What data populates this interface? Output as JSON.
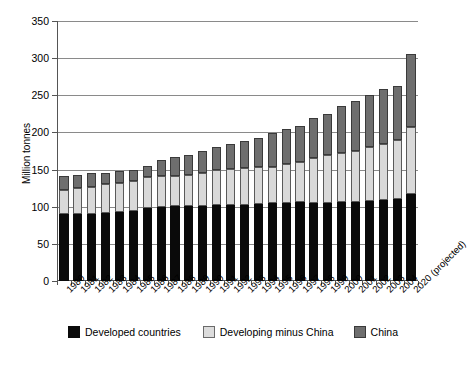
{
  "chart_data": {
    "type": "bar",
    "subtype": "stacked-vertical",
    "title": "",
    "xlabel": "",
    "ylabel": "Million tonnes",
    "ylim": [
      0,
      350
    ],
    "yticks": [
      0,
      50,
      100,
      150,
      200,
      250,
      300,
      350
    ],
    "grid": true,
    "legend_position": "bottom",
    "categories": [
      "1980",
      "1981",
      "1982",
      "1983",
      "1984",
      "1985",
      "1986",
      "1987",
      "1988",
      "1989",
      "1990",
      "1991",
      "1992",
      "1993",
      "1994",
      "1995",
      "1996",
      "1997",
      "1998",
      "1999",
      "2000",
      "2001",
      "2002",
      "2003",
      "2004",
      "2020 (projected)"
    ],
    "series": [
      {
        "name": "Developed countries",
        "color": "#0a0a0a",
        "values": [
          90,
          90,
          90,
          91,
          93,
          94,
          98,
          99,
          101,
          101,
          101,
          102,
          102,
          103,
          104,
          105,
          105,
          106,
          105,
          105,
          106,
          106,
          108,
          109,
          110,
          117
        ]
      },
      {
        "name": "Developing minus China",
        "color": "#d9d9d9",
        "values": [
          32,
          35,
          37,
          39,
          39,
          40,
          42,
          43,
          41,
          42,
          45,
          47,
          49,
          49,
          50,
          49,
          52,
          54,
          61,
          64,
          67,
          69,
          72,
          76,
          80,
          90
        ]
      },
      {
        "name": "China",
        "color": "#6e6e6e",
        "values": [
          19,
          18,
          18,
          16,
          16,
          16,
          15,
          21,
          25,
          27,
          29,
          31,
          33,
          37,
          39,
          45,
          48,
          49,
          53,
          56,
          62,
          67,
          70,
          73,
          73,
          99
        ]
      }
    ],
    "totals": [
      141,
      143,
      145,
      146,
      148,
      150,
      155,
      163,
      167,
      170,
      175,
      180,
      184,
      189,
      193,
      199,
      205,
      209,
      219,
      225,
      235,
      242,
      250,
      258,
      263,
      306
    ]
  },
  "legend": {
    "items": [
      {
        "label": "Developed countries",
        "swatch": "black-square"
      },
      {
        "label": "Developing minus China",
        "swatch": "light-gray-square"
      },
      {
        "label": "China",
        "swatch": "dark-gray-square"
      }
    ]
  },
  "axes": {
    "y_title": "Million tonnes"
  }
}
